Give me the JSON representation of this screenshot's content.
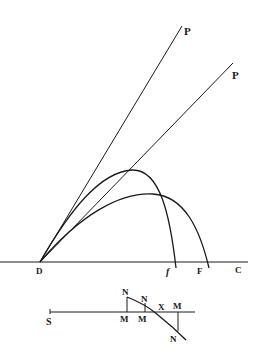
{
  "figure": {
    "upper": {
      "labels": {
        "P1": "P",
        "P2": "P",
        "D": "D",
        "f": "f",
        "F": "F",
        "C": "C"
      }
    },
    "lower": {
      "labels": {
        "S": "S",
        "N1": "N",
        "N2": "N",
        "N3": "N",
        "M1": "M",
        "M2": "M",
        "M3": "M",
        "X": "X"
      }
    }
  }
}
